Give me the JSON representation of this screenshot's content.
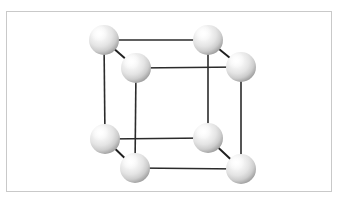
{
  "figure": {
    "background_color": "#ffffff",
    "frame": {
      "x": 6,
      "y": 11,
      "width": 326,
      "height": 181,
      "border_color": "#c9c9c9",
      "border_width": 1
    }
  },
  "lattice": {
    "structure_type": "simple cubic",
    "atom_count": 8,
    "edge_count": 12,
    "edge_color": "#2b2b2b",
    "atom_fill_highlight": "#ffffff",
    "atom_fill_mid": "#e3e3e3",
    "atom_fill_shadow": "#9c9c9c",
    "projection": "oblique",
    "depth_offset_x": 32,
    "depth_offset_y": 29,
    "atom_radius": 15,
    "atoms": [
      {
        "id": "back-top-left",
        "label": "A",
        "x": 104,
        "y": 40,
        "r": 15,
        "face": "back",
        "corner": "top-left"
      },
      {
        "id": "back-top-right",
        "label": "B",
        "x": 208,
        "y": 40,
        "r": 15,
        "face": "back",
        "corner": "top-right"
      },
      {
        "id": "back-bottom-left",
        "label": "C",
        "x": 105,
        "y": 139,
        "r": 15,
        "face": "back",
        "corner": "bottom-left"
      },
      {
        "id": "back-bottom-right",
        "label": "D",
        "x": 208,
        "y": 138,
        "r": 15,
        "face": "back",
        "corner": "bottom-right"
      },
      {
        "id": "front-top-left",
        "label": "E",
        "x": 136,
        "y": 68,
        "r": 15,
        "face": "front",
        "corner": "top-left"
      },
      {
        "id": "front-top-right",
        "label": "F",
        "x": 241,
        "y": 67,
        "r": 15,
        "face": "front",
        "corner": "top-right"
      },
      {
        "id": "front-bottom-left",
        "label": "G",
        "x": 135,
        "y": 168,
        "r": 15,
        "face": "front",
        "corner": "bottom-left"
      },
      {
        "id": "front-bottom-right",
        "label": "H",
        "x": 241,
        "y": 169,
        "r": 15,
        "face": "front",
        "corner": "bottom-right"
      }
    ],
    "edges": [
      {
        "id": "back-top",
        "from": "back-top-left",
        "to": "back-top-right",
        "x1": 104,
        "y1": 40,
        "x2": 208,
        "y2": 40,
        "kind": "horizontal"
      },
      {
        "id": "back-bottom",
        "from": "back-bottom-left",
        "to": "back-bottom-right",
        "x1": 105,
        "y1": 139,
        "x2": 208,
        "y2": 138,
        "kind": "horizontal"
      },
      {
        "id": "back-left",
        "from": "back-top-left",
        "to": "back-bottom-left",
        "x1": 104,
        "y1": 40,
        "x2": 105,
        "y2": 139,
        "kind": "vertical"
      },
      {
        "id": "back-right",
        "from": "back-top-right",
        "to": "back-bottom-right",
        "x1": 208,
        "y1": 40,
        "x2": 208,
        "y2": 138,
        "kind": "vertical"
      },
      {
        "id": "front-top",
        "from": "front-top-left",
        "to": "front-top-right",
        "x1": 136,
        "y1": 68,
        "x2": 241,
        "y2": 67,
        "kind": "horizontal"
      },
      {
        "id": "front-bottom",
        "from": "front-bottom-left",
        "to": "front-bottom-right",
        "x1": 135,
        "y1": 168,
        "x2": 241,
        "y2": 169,
        "kind": "horizontal"
      },
      {
        "id": "front-left",
        "from": "front-top-left",
        "to": "front-bottom-left",
        "x1": 136,
        "y1": 68,
        "x2": 135,
        "y2": 168,
        "kind": "vertical"
      },
      {
        "id": "front-right",
        "from": "front-top-right",
        "to": "front-bottom-right",
        "x1": 241,
        "y1": 67,
        "x2": 241,
        "y2": 169,
        "kind": "vertical"
      },
      {
        "id": "depth-top-left",
        "from": "back-top-left",
        "to": "front-top-left",
        "x1": 104,
        "y1": 40,
        "x2": 136,
        "y2": 68,
        "kind": "diagonal"
      },
      {
        "id": "depth-top-right",
        "from": "back-top-right",
        "to": "front-top-right",
        "x1": 208,
        "y1": 40,
        "x2": 241,
        "y2": 67,
        "kind": "diagonal"
      },
      {
        "id": "depth-bottom-left",
        "from": "back-bottom-left",
        "to": "front-bottom-left",
        "x1": 105,
        "y1": 139,
        "x2": 135,
        "y2": 168,
        "kind": "diagonal"
      },
      {
        "id": "depth-bottom-right",
        "from": "back-bottom-right",
        "to": "front-bottom-right",
        "x1": 208,
        "y1": 138,
        "x2": 241,
        "y2": 169,
        "kind": "diagonal"
      }
    ]
  }
}
